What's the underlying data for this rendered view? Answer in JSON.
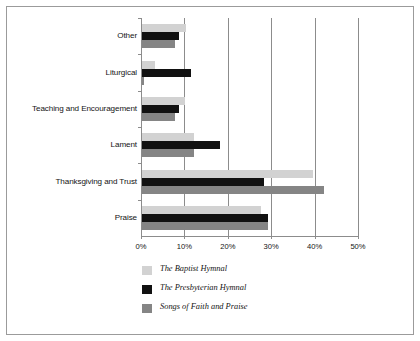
{
  "chart_data": {
    "type": "bar",
    "orientation": "horizontal",
    "title": "",
    "xlabel": "",
    "ylabel": "",
    "categories": [
      "Praise",
      "Thanksgiving and Trust",
      "Lament",
      "Teaching and Encouragement",
      "Liturgical",
      "Other"
    ],
    "series": [
      {
        "name": "The Baptist Hymnal",
        "color": "#d2d2d2",
        "values": [
          27.5,
          39.5,
          12.0,
          10.0,
          3.0,
          10.2
        ]
      },
      {
        "name": "The Presbyterian Hymnal",
        "color": "#111111",
        "values": [
          29.0,
          28.0,
          18.0,
          8.5,
          11.2,
          8.5
        ]
      },
      {
        "name": "Songs of Faith and Praise",
        "color": "#858585",
        "values": [
          29.0,
          42.0,
          12.0,
          7.5,
          0.4,
          7.5
        ]
      }
    ],
    "xlim": [
      0,
      50
    ],
    "x_ticks": [
      0,
      10,
      20,
      30,
      40,
      50
    ],
    "x_tick_labels": [
      "0%",
      "10%",
      "20%",
      "30%",
      "40%",
      "50%"
    ],
    "grid": true,
    "legend_position": "bottom-left"
  },
  "legend": {
    "items": [
      {
        "label": "The Baptist Hymnal",
        "color": "#d2d2d2"
      },
      {
        "label": "The Presbyterian Hymnal",
        "color": "#111111"
      },
      {
        "label": "Songs of Faith and Praise",
        "color": "#858585"
      }
    ]
  }
}
